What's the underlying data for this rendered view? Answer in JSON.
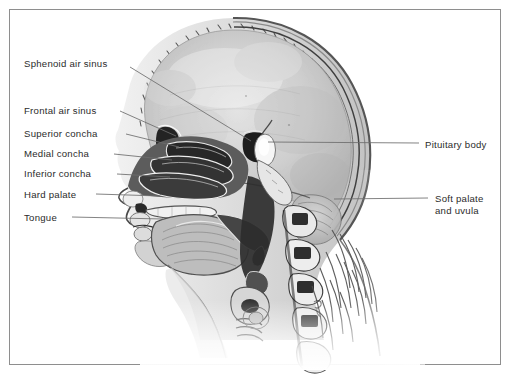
{
  "figure": {
    "background_color": "#ffffff",
    "frame_color": "#8e8e8e",
    "label_color": "#2b2b2b",
    "leader_color": "#6d6d6d",
    "artist_signature": "G."
  },
  "labels_left": [
    {
      "id": "sphenoid-air-sinus",
      "text": "Sphenoid air sinus",
      "x": 24,
      "y": 58,
      "leader": {
        "x1": 130,
        "y1": 67,
        "x2": 251,
        "y2": 141
      }
    },
    {
      "id": "frontal-air-sinus",
      "text": "Frontal air sinus",
      "x": 24,
      "y": 105,
      "leader": {
        "x1": 120,
        "y1": 111,
        "x2": 176,
        "y2": 136
      }
    },
    {
      "id": "superior-concha",
      "text": "Superior concha",
      "x": 24,
      "y": 128,
      "leader": {
        "x1": 126,
        "y1": 134,
        "x2": 179,
        "y2": 147
      }
    },
    {
      "id": "medial-concha",
      "text": "Medial concha",
      "x": 24,
      "y": 148,
      "leader": {
        "x1": 114,
        "y1": 154,
        "x2": 172,
        "y2": 160
      }
    },
    {
      "id": "inferior-concha",
      "text": "Inferior concha",
      "x": 24,
      "y": 168,
      "leader": {
        "x1": 117,
        "y1": 174,
        "x2": 170,
        "y2": 177
      }
    },
    {
      "id": "hard-palate",
      "text": "Hard palate",
      "x": 24,
      "y": 189,
      "leader": {
        "x1": 96,
        "y1": 194,
        "x2": 160,
        "y2": 196
      }
    },
    {
      "id": "tongue",
      "text": "Tongue",
      "x": 24,
      "y": 212,
      "leader": {
        "x1": 72,
        "y1": 217,
        "x2": 163,
        "y2": 219
      }
    }
  ],
  "labels_right": [
    {
      "id": "pituitary-body",
      "text": "Pituitary body",
      "x": 425,
      "y": 139,
      "leader": {
        "x1": 419,
        "y1": 143,
        "x2": 268,
        "y2": 142
      }
    },
    {
      "id": "soft-palate-and-uvula",
      "text": "Soft palate\nand uvula",
      "x": 435,
      "y": 193,
      "leader": {
        "x1": 428,
        "y1": 198,
        "x2": 334,
        "y2": 199
      }
    }
  ]
}
